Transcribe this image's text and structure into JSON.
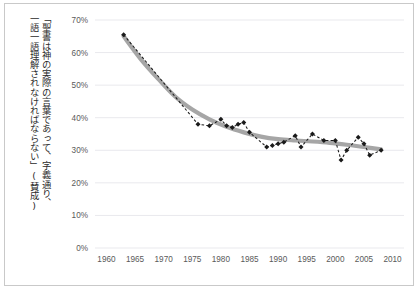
{
  "figure": {
    "background_color": "#ffffff",
    "frame_color": "#c9c9c9",
    "axis_title_vertical": "「聖書は神の実際の言葉であって、字義通り、一語一語理解されなければならない」(賛成)",
    "axis_title_line_1": "「聖書は神の実際の言葉であって、字義通り、",
    "axis_title_line_2": "一語一語理解されなければならない」(賛成)"
  },
  "chart_data": {
    "type": "line",
    "title": "",
    "subtitle": "",
    "xlabel": "",
    "ylabel": "「聖書は神の実際の言葉であって、字義通り、一語一語理解されなければならない」(賛成)",
    "xlim": [
      1958,
      2012
    ],
    "ylim": [
      0,
      70
    ],
    "ytick_labels": [
      "0%",
      "10%",
      "20%",
      "30%",
      "40%",
      "50%",
      "60%",
      "70%"
    ],
    "ytick_values": [
      0,
      10,
      20,
      30,
      40,
      50,
      60,
      70
    ],
    "xtick_labels": [
      "1960",
      "1965",
      "1970",
      "1975",
      "1980",
      "1985",
      "1990",
      "1995",
      "2000",
      "2005",
      "2010"
    ],
    "xtick_values": [
      1960,
      1965,
      1970,
      1975,
      1980,
      1985,
      1990,
      1995,
      2000,
      2005,
      2010
    ],
    "grid": "horizontal",
    "legend": "none",
    "series": [
      {
        "name": "survey-points",
        "style": "dashed-with-diamond-markers",
        "color": "#1a1a1a",
        "marker": "diamond",
        "x": [
          1963,
          1976,
          1978,
          1980,
          1981,
          1982,
          1983,
          1984,
          1985,
          1988,
          1989,
          1990,
          1991,
          1993,
          1994,
          1996,
          1998,
          2000,
          2001,
          2002,
          2004,
          2005,
          2006,
          2008
        ],
        "values": [
          65.5,
          38.0,
          37.5,
          39.5,
          37.5,
          37.0,
          38.0,
          38.5,
          35.5,
          31.0,
          31.5,
          32.0,
          32.5,
          34.5,
          31.0,
          35.0,
          33.0,
          33.0,
          27.0,
          30.0,
          34.0,
          32.0,
          28.5,
          30.0
        ]
      },
      {
        "name": "trend-line",
        "style": "smooth-thick",
        "color": "#a6a6a6",
        "x": [
          1963,
          1966,
          1969,
          1972,
          1975,
          1978,
          1981,
          1984,
          1987,
          1990,
          1993,
          1996,
          1999,
          2002,
          2005,
          2008
        ],
        "values": [
          65.0,
          58.0,
          52.0,
          46.5,
          42.5,
          39.5,
          37.2,
          35.5,
          34.2,
          33.4,
          33.0,
          32.7,
          32.3,
          31.7,
          31.0,
          30.3
        ]
      }
    ]
  }
}
